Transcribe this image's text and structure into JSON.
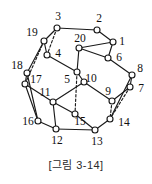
{
  "figure": {
    "caption": "[그림 3-14]",
    "width": 152,
    "height": 184
  },
  "chart_data": {
    "type": "diagram",
    "subtype": "graph-node-link",
    "title": "[그림 3-14]",
    "node_count": 20,
    "edge_count": 30,
    "node_radius": 3.0,
    "colors": {
      "stroke": "#1a1a1a",
      "node_fill": "#ffffff",
      "label": "#111111",
      "background": "#ffffff",
      "caption": "#2b2b2b"
    },
    "nodes": [
      {
        "id": 1,
        "label": "1",
        "x": 113,
        "y": 42,
        "lx": 122,
        "ly": 42
      },
      {
        "id": 2,
        "label": "2",
        "x": 97,
        "y": 30,
        "lx": 99,
        "ly": 19
      },
      {
        "id": 3,
        "label": "3",
        "x": 57,
        "y": 28,
        "lx": 58,
        "ly": 17
      },
      {
        "id": 4,
        "label": "4",
        "x": 47,
        "y": 55,
        "lx": 58,
        "ly": 54
      },
      {
        "id": 5,
        "label": "5",
        "x": 77,
        "y": 72,
        "lx": 67,
        "ly": 80
      },
      {
        "id": 6,
        "label": "6",
        "x": 108,
        "y": 58,
        "lx": 119,
        "ly": 58
      },
      {
        "id": 7,
        "label": "7",
        "x": 130,
        "y": 87,
        "lx": 141,
        "ly": 89
      },
      {
        "id": 8,
        "label": "8",
        "x": 132,
        "y": 75,
        "lx": 140,
        "ly": 69
      },
      {
        "id": 9,
        "label": "9",
        "x": 112,
        "y": 101,
        "lx": 108,
        "ly": 92
      },
      {
        "id": 10,
        "label": "10",
        "x": 84,
        "y": 82,
        "lx": 91,
        "ly": 79
      },
      {
        "id": 11,
        "label": "11",
        "x": 53,
        "y": 102,
        "lx": 45,
        "ly": 93
      },
      {
        "id": 12,
        "label": "12",
        "x": 56,
        "y": 129,
        "lx": 57,
        "ly": 141
      },
      {
        "id": 13,
        "label": "13",
        "x": 95,
        "y": 130,
        "lx": 97,
        "ly": 142
      },
      {
        "id": 14,
        "label": "14",
        "x": 110,
        "y": 119,
        "lx": 124,
        "ly": 123
      },
      {
        "id": 15,
        "label": "15",
        "x": 75,
        "y": 114,
        "lx": 80,
        "ly": 122
      },
      {
        "id": 16,
        "label": "16",
        "x": 38,
        "y": 121,
        "lx": 28,
        "ly": 122
      },
      {
        "id": 17,
        "label": "17",
        "x": 25,
        "y": 84,
        "lx": 36,
        "ly": 80
      },
      {
        "id": 18,
        "label": "18",
        "x": 27,
        "y": 73,
        "lx": 17,
        "ly": 66
      },
      {
        "id": 19,
        "label": "19",
        "x": 44,
        "y": 41,
        "lx": 32,
        "ly": 33
      },
      {
        "id": 20,
        "label": "20",
        "x": 79,
        "y": 48,
        "lx": 80,
        "ly": 39
      }
    ],
    "edges": [
      {
        "from": 1,
        "to": 2,
        "style": "solid"
      },
      {
        "from": 1,
        "to": 20,
        "style": "solid"
      },
      {
        "from": 1,
        "to": 6,
        "style": "solid"
      },
      {
        "from": 2,
        "to": 3,
        "style": "solid"
      },
      {
        "from": 3,
        "to": 19,
        "style": "solid"
      },
      {
        "from": 3,
        "to": 4,
        "style": "dashed"
      },
      {
        "from": 4,
        "to": 19,
        "style": "solid"
      },
      {
        "from": 4,
        "to": 5,
        "style": "solid"
      },
      {
        "from": 5,
        "to": 20,
        "style": "solid"
      },
      {
        "from": 5,
        "to": 10,
        "style": "solid"
      },
      {
        "from": 5,
        "to": 15,
        "style": "dashed"
      },
      {
        "from": 6,
        "to": 20,
        "style": "solid"
      },
      {
        "from": 6,
        "to": 8,
        "style": "solid"
      },
      {
        "from": 7,
        "to": 8,
        "style": "solid"
      },
      {
        "from": 7,
        "to": 9,
        "style": "solid"
      },
      {
        "from": 7,
        "to": 14,
        "style": "dashed"
      },
      {
        "from": 9,
        "to": 10,
        "style": "solid"
      },
      {
        "from": 9,
        "to": 14,
        "style": "dashed"
      },
      {
        "from": 10,
        "to": 11,
        "style": "solid"
      },
      {
        "from": 11,
        "to": 17,
        "style": "solid"
      },
      {
        "from": 11,
        "to": 12,
        "style": "solid"
      },
      {
        "from": 12,
        "to": 16,
        "style": "solid"
      },
      {
        "from": 12,
        "to": 13,
        "style": "solid"
      },
      {
        "from": 13,
        "to": 14,
        "style": "solid"
      },
      {
        "from": 13,
        "to": 15,
        "style": "solid"
      },
      {
        "from": 14,
        "to": 8,
        "style": "solid"
      },
      {
        "from": 15,
        "to": 11,
        "style": "solid"
      },
      {
        "from": 16,
        "to": 17,
        "style": "solid"
      },
      {
        "from": 17,
        "to": 18,
        "style": "solid"
      },
      {
        "from": 18,
        "to": 19,
        "style": "solid"
      },
      {
        "from": 18,
        "to": 16,
        "style": "solid"
      },
      {
        "from": 19,
        "to": 17,
        "style": "dashed"
      }
    ]
  }
}
